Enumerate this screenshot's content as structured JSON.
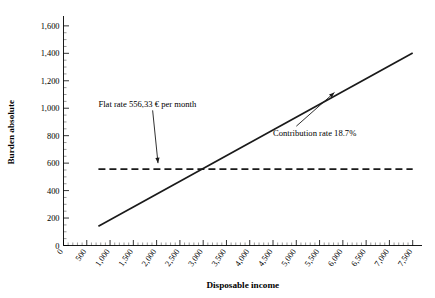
{
  "chart_data": {
    "type": "line",
    "title": "",
    "xlabel": "Disposable income",
    "ylabel": "Burden absolute",
    "xlim": [
      0,
      7700
    ],
    "ylim": [
      0,
      1650
    ],
    "grid": false,
    "legend_position": "none",
    "x_ticks": [
      "0",
      "500",
      "1,000",
      "1,500",
      "2,000",
      "2,500",
      "3,000",
      "3,500",
      "4,000",
      "4,500",
      "5,000",
      "5,500",
      "6,000",
      "6,500",
      "7,000",
      "7,500"
    ],
    "x_tick_values": [
      0,
      500,
      1000,
      1500,
      2000,
      2500,
      3000,
      3500,
      4000,
      4500,
      5000,
      5500,
      6000,
      6500,
      7000,
      7500
    ],
    "y_ticks": [
      "0",
      "200",
      "400",
      "600",
      "800",
      "1,000",
      "1,200",
      "1,400",
      "1,600"
    ],
    "y_tick_values": [
      0,
      200,
      400,
      600,
      800,
      1000,
      1200,
      1400,
      1600
    ],
    "x_minor_step": 100,
    "y_minor_step": 50,
    "series": [
      {
        "name": "Flat rate",
        "style": "dashed",
        "color": "#1a1a1a",
        "x": [
          750,
          7500
        ],
        "values": [
          556.33,
          556.33
        ]
      },
      {
        "name": "Contribution rate 18.7%",
        "style": "solid",
        "color": "#1a1a1a",
        "x": [
          750,
          7500
        ],
        "values": [
          140.25,
          1402.5
        ]
      }
    ],
    "annotations": [
      {
        "id": "flat-rate",
        "text": "Flat rate 556,33 € per month",
        "text_x": 750,
        "text_y": 1010,
        "target_x": 2030,
        "target_y": 600
      },
      {
        "id": "contribution-rate",
        "text": "Contribution rate 18.7%",
        "text_x": 4500,
        "text_y": 800,
        "target_x": 5820,
        "target_y": 1115
      }
    ]
  }
}
